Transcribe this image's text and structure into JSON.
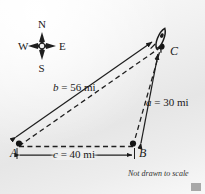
{
  "figure": {
    "caption": "Not drawn to scale",
    "compass": {
      "north": "N",
      "south": "S",
      "east": "E",
      "west": "W"
    },
    "vertices": {
      "a_label": "A",
      "b_label": "B",
      "c_label": "C"
    },
    "dimensions": {
      "side_b": "b = 56 mi",
      "side_a": "a = 30 mi",
      "side_c": "c = 40 mi"
    },
    "icons": {
      "airplane": "airplane-icon",
      "compass": "compass-rose-icon"
    },
    "colors": {
      "ink": "#1a1a1a",
      "background_light": "#fcfcfc",
      "background_dark": "#e6e6e6",
      "corner_mark": "#a8a8a8"
    }
  },
  "chart_data": {
    "type": "diagram",
    "points": [
      {
        "name": "A",
        "x": 17,
        "y": 147
      },
      {
        "name": "B",
        "x": 134,
        "y": 147
      },
      {
        "name": "C",
        "x": 162,
        "y": 46
      }
    ],
    "sides": [
      {
        "name": "a",
        "from": "B",
        "to": "C",
        "length": 30,
        "unit": "mi",
        "label": "a = 30 mi"
      },
      {
        "name": "b",
        "from": "A",
        "to": "C",
        "length": 56,
        "unit": "mi",
        "label": "b = 56 mi"
      },
      {
        "name": "c",
        "from": "A",
        "to": "B",
        "length": 40,
        "unit": "mi",
        "label": "c = 40 mi"
      }
    ],
    "annotations": [
      "Not drawn to scale"
    ],
    "legend": []
  }
}
